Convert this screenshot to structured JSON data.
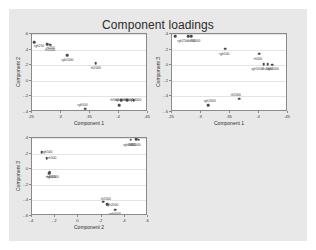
{
  "chart_title": "Component loadings",
  "canvas": {
    "background_color": "#e8e8e8",
    "page_background_color": "#ffffff",
    "plot_background_color": "#ffffff",
    "marker_color": "#4a4a4a",
    "axis_color": "#8a8a8a",
    "grid_color": "#e4e4e4"
  },
  "chart_data": [
    {
      "type": "scatter",
      "title": "Component loadings",
      "panel": "component2-vs-component1",
      "xlabel": "Component 1",
      "ylabel": "Component 2",
      "xlim": [
        0.25,
        0.45
      ],
      "ylim": [
        -0.4,
        0.6
      ],
      "xticks": [
        ".25",
        ".3",
        ".35",
        ".4",
        ".45"
      ],
      "xtick_values": [
        0.25,
        0.3,
        0.35,
        0.4,
        0.45
      ],
      "yticks": [
        ".6",
        ".4",
        ".2",
        "0",
        "-.2",
        "-.4"
      ],
      "ytick_values": [
        0.6,
        0.4,
        0.2,
        0,
        -0.2,
        -0.4
      ],
      "grid": true,
      "legend": "none",
      "points": [
        {
          "label": "rgh250",
          "x": 0.254,
          "y": 0.495,
          "lx": 0.262,
          "ly": 0.455
        },
        {
          "label": "rh250",
          "x": 0.276,
          "y": 0.47,
          "lx": 0.282,
          "ly": 0.43
        },
        {
          "label": "rh1000",
          "x": 0.281,
          "y": 0.462,
          "lx": 0.281,
          "ly": 0.405
        },
        {
          "label": "rgh1000",
          "x": 0.311,
          "y": 0.327,
          "lx": 0.311,
          "ly": 0.277
        },
        {
          "label": "rh2000",
          "x": 0.36,
          "y": 0.222,
          "lx": 0.36,
          "ly": 0.172
        },
        {
          "label": "rgh500",
          "x": 0.342,
          "y": -0.36,
          "lx": 0.337,
          "ly": -0.3
        },
        {
          "label": "rh500",
          "x": 0.4,
          "y": -0.315,
          "lx": 0.392,
          "ly": -0.228
        },
        {
          "label": "rgh2000",
          "x": 0.404,
          "y": -0.25,
          "lx": 0.404,
          "ly": -0.228
        },
        {
          "label": "rh4000",
          "x": 0.414,
          "y": -0.248,
          "lx": 0.416,
          "ly": -0.228
        },
        {
          "label": "rgh4000",
          "x": 0.425,
          "y": -0.248,
          "lx": 0.428,
          "ly": -0.228
        }
      ]
    },
    {
      "type": "scatter",
      "title": "Component loadings",
      "panel": "component3-vs-component1",
      "xlabel": "Component 1",
      "ylabel": "Component 3",
      "xlim": [
        0.25,
        0.45
      ],
      "ylim": [
        -0.6,
        0.4
      ],
      "xticks": [
        ".25",
        ".3",
        ".35",
        ".4",
        ".45"
      ],
      "xtick_values": [
        0.25,
        0.3,
        0.35,
        0.4,
        0.45
      ],
      "yticks": [
        ".4",
        ".2",
        "0",
        "-.2",
        "-.4",
        "-.6"
      ],
      "ytick_values": [
        0.4,
        0.2,
        0,
        -0.2,
        -0.4,
        -0.6
      ],
      "grid": true,
      "legend": "none",
      "points": [
        {
          "label": "rgh250",
          "x": 0.256,
          "y": 0.37,
          "lx": 0.268,
          "ly": 0.318
        },
        {
          "label": "rh250",
          "x": 0.278,
          "y": 0.372,
          "lx": 0.283,
          "ly": 0.318
        },
        {
          "label": "rh1000",
          "x": 0.283,
          "y": 0.368,
          "lx": 0.29,
          "ly": 0.318
        },
        {
          "label": "rgh500",
          "x": 0.342,
          "y": 0.212,
          "lx": 0.34,
          "ly": 0.16
        },
        {
          "label": "rh500",
          "x": 0.4,
          "y": 0.148,
          "lx": 0.398,
          "ly": 0.096
        },
        {
          "label": "rgh1000",
          "x": 0.408,
          "y": 0.012,
          "lx": 0.397,
          "ly": -0.038
        },
        {
          "label": "rh4000",
          "x": 0.415,
          "y": 0.01,
          "lx": 0.414,
          "ly": -0.038
        },
        {
          "label": "rgh4000",
          "x": 0.423,
          "y": 0.005,
          "lx": 0.424,
          "ly": -0.038
        },
        {
          "label": "rh2000",
          "x": 0.366,
          "y": -0.43,
          "lx": 0.36,
          "ly": -0.372
        },
        {
          "label": "rgh2000",
          "x": 0.312,
          "y": -0.51,
          "lx": 0.315,
          "ly": -0.452
        }
      ]
    },
    {
      "type": "scatter",
      "title": "Component loadings",
      "panel": "component3-vs-component2",
      "xlabel": "Component 2",
      "ylabel": "Component 3",
      "xlim": [
        -0.4,
        0.6
      ],
      "ylim": [
        -0.6,
        0.4
      ],
      "xticks": [
        "-.4",
        "-.2",
        "0",
        ".2",
        ".4",
        ".6"
      ],
      "xtick_values": [
        -0.4,
        -0.2,
        0,
        0.2,
        0.4,
        0.6
      ],
      "yticks": [
        ".4",
        ".2",
        "0",
        "-.2",
        "-.4",
        "-.6"
      ],
      "ytick_values": [
        0.4,
        0.2,
        0,
        -0.2,
        -0.4,
        -0.6
      ],
      "grid": true,
      "legend": "none",
      "points": [
        {
          "label": "rgh250",
          "x": 0.452,
          "y": 0.378,
          "lx": 0.43,
          "ly": 0.318
        },
        {
          "label": "rh250",
          "x": 0.497,
          "y": 0.382,
          "lx": 0.462,
          "ly": 0.318
        },
        {
          "label": "rh1000",
          "x": 0.52,
          "y": 0.38,
          "lx": 0.492,
          "ly": 0.318
        },
        {
          "label": "rgh500",
          "x": -0.318,
          "y": 0.218,
          "lx": -0.268,
          "ly": 0.228
        },
        {
          "label": "rh500",
          "x": -0.272,
          "y": 0.142,
          "lx": -0.226,
          "ly": 0.152
        },
        {
          "label": "rgh1000",
          "x": -0.248,
          "y": -0.042,
          "lx": -0.22,
          "ly": -0.092
        },
        {
          "label": "rh4000",
          "x": -0.252,
          "y": -0.05,
          "lx": -0.238,
          "ly": -0.092
        },
        {
          "label": "rh2000",
          "x": 0.212,
          "y": -0.418,
          "lx": 0.236,
          "ly": -0.37
        },
        {
          "label": "rgh2000",
          "x": 0.248,
          "y": -0.452,
          "lx": 0.292,
          "ly": -0.452
        },
        {
          "label": "rgh4000",
          "x": 0.316,
          "y": -0.518,
          "lx": 0.316,
          "ly": -0.56
        }
      ]
    }
  ]
}
